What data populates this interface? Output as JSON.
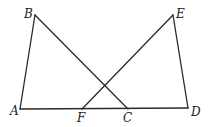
{
  "diagram": {
    "type": "geometry",
    "points": {
      "A": {
        "label": "A",
        "x": 20,
        "y": 109,
        "lx": 10,
        "ly": 115
      },
      "B": {
        "label": "B",
        "x": 35,
        "y": 15,
        "lx": 24,
        "ly": 18
      },
      "C": {
        "label": "C",
        "x": 128,
        "y": 109,
        "lx": 123,
        "ly": 122
      },
      "D": {
        "label": "D",
        "x": 188,
        "y": 108,
        "lx": 191,
        "ly": 116
      },
      "E": {
        "label": "E",
        "x": 173,
        "y": 15,
        "lx": 176,
        "ly": 18
      },
      "F": {
        "label": "F",
        "x": 82,
        "y": 109,
        "lx": 77,
        "ly": 122
      }
    },
    "segments": [
      [
        "A",
        "B"
      ],
      [
        "B",
        "C"
      ],
      [
        "A",
        "D"
      ],
      [
        "F",
        "E"
      ],
      [
        "E",
        "D"
      ]
    ],
    "stroke_color": "#2a2a2a"
  }
}
